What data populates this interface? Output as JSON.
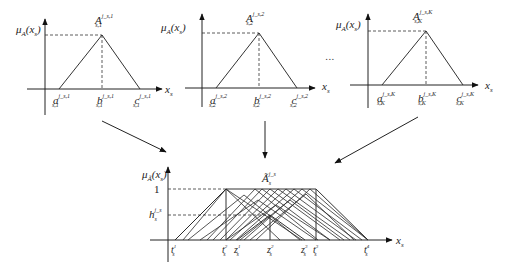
{
  "diagram": {
    "top_panels": [
      {
        "y_label": "μ_A(x_s)",
        "y_main": "μ",
        "y_sub": "A",
        "y_arg": "(x",
        "y_arg_sub": "s",
        "y_close": ")",
        "apex_main": "A",
        "apex_sup": "j_s,1",
        "apex_sub": "s,1",
        "a_main": "a",
        "a_sup": "j_s,1",
        "a_sub": "s,1",
        "b_main": "b",
        "b_sup": "j_s,1",
        "b_sub": "s,1",
        "c_main": "c",
        "c_sup": "j_s,1",
        "c_sub": "s,1",
        "x_main": "x",
        "x_sub": "s"
      },
      {
        "y_label": "μ_A(x_s)",
        "y_main": "μ",
        "y_sub": "A",
        "y_arg": "(x",
        "y_arg_sub": "s",
        "y_close": ")",
        "apex_main": "A",
        "apex_sup": "j_s,2",
        "apex_sub": "s,2",
        "a_main": "a",
        "a_sup": "j_s,2",
        "a_sub": "s,2",
        "b_main": "b",
        "b_sup": "j_s,2",
        "b_sub": "s,2",
        "c_main": "c",
        "c_sup": "j_s,2",
        "c_sub": "s,2",
        "x_main": "x",
        "x_sub": "s"
      },
      {
        "y_label": "μ_A(x_s)",
        "y_main": "μ",
        "y_sub": "A",
        "y_arg": "(x",
        "y_arg_sub": "s",
        "y_close": ")",
        "apex_main": "A",
        "apex_sup": "j_s,K",
        "apex_sub": "s,K",
        "a_main": "a",
        "a_sup": "j_s,K",
        "a_sub": "s,K",
        "b_main": "b",
        "b_sup": "j_s,K",
        "b_sub": "s,K",
        "c_main": "c",
        "c_sup": "j_s,K",
        "c_sub": "s,K",
        "x_main": "x",
        "x_sub": "s"
      }
    ],
    "ellipsis": "...",
    "bottom_panel": {
      "y_main": "μ",
      "y_sub": "Ã",
      "y_arg": "(x",
      "y_arg_sub": "s",
      "y_close": ")",
      "title_main": "Ã",
      "title_sup": "j_s",
      "title_sub": "s",
      "level_one": "1",
      "level_h_main": "h",
      "level_h_sup": "j_s",
      "level_h_sub": "s",
      "x_main": "x",
      "x_sub": "s",
      "ticks": [
        {
          "main": "t",
          "sup": "j_s",
          "sub": "s",
          "index": "1"
        },
        {
          "main": "t",
          "sup": "j_s",
          "sub": "s",
          "index": "2"
        },
        {
          "main": "z",
          "sup": "j_s",
          "sub": "s",
          "index": "1"
        },
        {
          "main": "z",
          "sup": "j_s",
          "sub": "s",
          "index": "2"
        },
        {
          "main": "z",
          "sup": "j_s",
          "sub": "s",
          "index": "3"
        },
        {
          "main": "t",
          "sup": "j_s",
          "sub": "s",
          "index": "3"
        },
        {
          "main": "t",
          "sup": "j_s",
          "sub": "s",
          "index": "4"
        }
      ]
    }
  }
}
